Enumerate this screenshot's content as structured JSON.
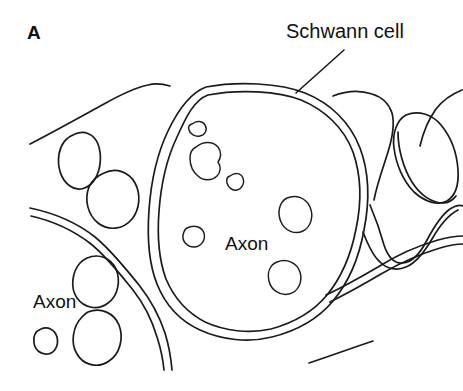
{
  "figure": {
    "panel_letter": "A",
    "background_color": "#ffffff",
    "ink_color": "#1a1a1a",
    "width": 463,
    "height": 391
  },
  "labels": {
    "schwann_cell": "Schwann cell",
    "axon_center": "Axon",
    "axon_left": "Axon"
  },
  "annotations": {
    "leader_line_name": "schwann-cell-leader-line"
  },
  "icons": {
    "panel_letter_name": "panel-letter-a"
  },
  "structures": {
    "large_axon_name": "large-myelinated-axon",
    "schwann_membrane_name": "schwann-cell-membrane",
    "small_axon_count": 5,
    "inner_organelle_count": 6
  }
}
